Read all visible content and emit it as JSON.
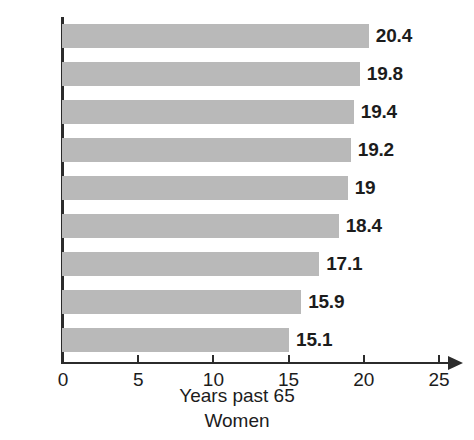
{
  "chart_data": {
    "type": "bar",
    "orientation": "horizontal",
    "title": "",
    "xlabel": "Years past 65",
    "sublabel": "Women",
    "ylabel": "",
    "categories": [
      "2030",
      "2020",
      "2010",
      "2000",
      "1990",
      "1980",
      "1970",
      "1960",
      "1950"
    ],
    "values": [
      20.4,
      19.8,
      19.4,
      19.2,
      19,
      18.4,
      17.1,
      15.9,
      15.1
    ],
    "value_labels": [
      "20.4",
      "19.8",
      "19.4",
      "19.2",
      "19",
      "18.4",
      "17.1",
      "15.9",
      "15.1"
    ],
    "xlim": [
      0,
      25
    ],
    "xticks": [
      0,
      5,
      10,
      15,
      20,
      25
    ],
    "xtick_labels": [
      "0",
      "5",
      "10",
      "15",
      "20",
      "25"
    ],
    "grid": false,
    "legend": null,
    "bar_color": "#b9b9b9",
    "axis_color": "#2b2b2b",
    "text_color": "#1c1c1c",
    "background": "#ffffff"
  },
  "axis": {
    "x_title": "Years past 65",
    "x_subtitle": "Women"
  }
}
